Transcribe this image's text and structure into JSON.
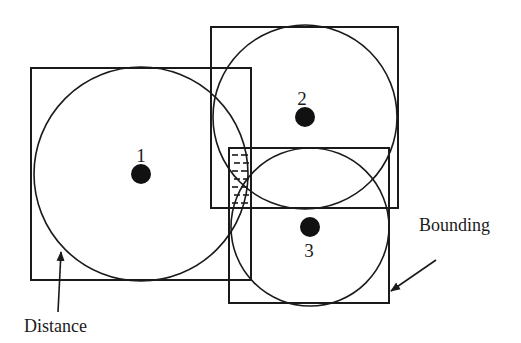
{
  "diagram": {
    "colors": {
      "stroke": "#1a1a1a",
      "background": "#ffffff",
      "dot": "#111111"
    },
    "nodes": [
      {
        "id": "1",
        "label": "1",
        "center": [
          141,
          174
        ],
        "circle_radius": 107,
        "bounding_box": {
          "x": 31,
          "y": 68,
          "w": 220,
          "h": 212
        },
        "label_pos": [
          141,
          146
        ]
      },
      {
        "id": "2",
        "label": "2",
        "center": [
          305,
          117
        ],
        "circle_radius": 92,
        "bounding_box": {
          "x": 211,
          "y": 27,
          "w": 187,
          "h": 181
        },
        "label_pos": [
          302,
          89
        ]
      },
      {
        "id": "3",
        "label": "3",
        "center": [
          310,
          227
        ],
        "circle_radius": 79,
        "bounding_box": {
          "x": 229,
          "y": 148,
          "w": 160,
          "h": 155
        },
        "label_pos": [
          309,
          241
        ]
      }
    ],
    "overlap_region": {
      "x": 229,
      "y": 148,
      "w": 22,
      "h": 60,
      "pattern": "dashed-hatch"
    },
    "annotations": [
      {
        "id": "bounding",
        "text": "Bounding",
        "text_pos": [
          419,
          216
        ],
        "arrow": {
          "from": [
            436,
            260
          ],
          "to": [
            391,
            291
          ]
        }
      },
      {
        "id": "distance",
        "text": "Distance",
        "text_pos": [
          24,
          317
        ],
        "arrow": {
          "from": [
            58,
            312
          ],
          "to": [
            61,
            252
          ]
        }
      }
    ]
  }
}
